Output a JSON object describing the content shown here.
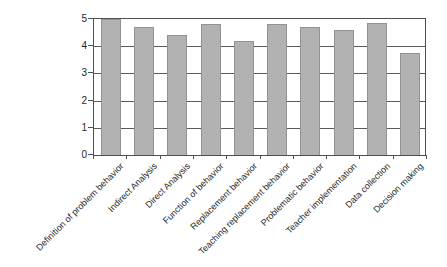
{
  "chart_data": {
    "type": "bar",
    "title": "",
    "xlabel": "",
    "ylabel": "",
    "categories": [
      "Definition of problem behavior",
      "Indirect Analysis",
      "Direct Analysis",
      "Function of behavior",
      "Replacement behavior",
      "Teaching replacement behavior",
      "Problematic behavior",
      "Teacher implementation",
      "Data collection",
      "Decision making"
    ],
    "values": [
      5.0,
      4.7,
      4.4,
      4.8,
      4.2,
      4.8,
      4.7,
      4.6,
      4.85,
      3.75
    ],
    "ylim": [
      0,
      5
    ],
    "yticks": [
      0,
      1,
      2,
      3,
      4,
      5
    ],
    "grid": true,
    "legend": false,
    "x_label_rotation_deg": 45,
    "colors": {
      "bar_fill": "#b2b2b2",
      "bar_border": "#929292",
      "axis_line": "#4f4f4f",
      "gridline": "#5a5a5a",
      "text": "#1f1f1f",
      "background": "#ffffff"
    }
  }
}
